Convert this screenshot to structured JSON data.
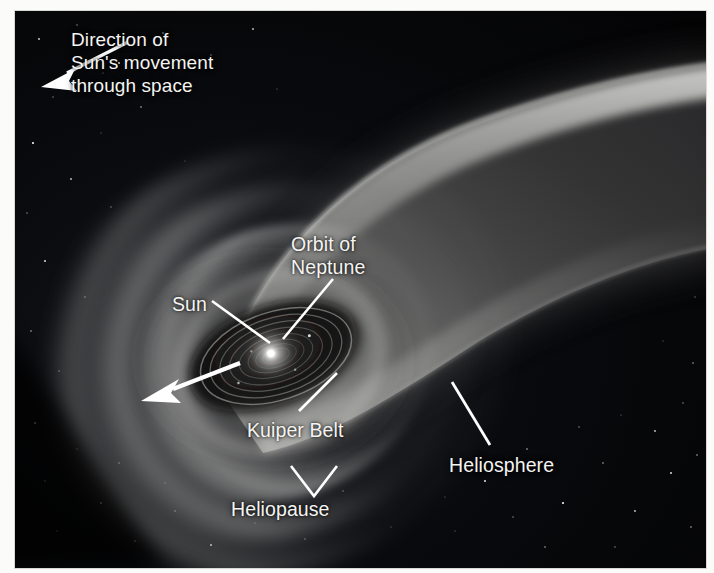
{
  "figure": {
    "background_color": "#050506",
    "label_color": "#f4f4f2",
    "plate_border_color": "#d8d8d6"
  },
  "labels": {
    "direction": "Direction of\nSun's movement\nthrough space",
    "orbit_of_neptune": "Orbit of\nNeptune",
    "sun": "Sun",
    "kuiper_belt": "Kuiper Belt",
    "heliopause": "Heliopause",
    "heliosphere": "Heliosphere"
  },
  "annotations": [
    {
      "name": "direction-of-motion-arrow",
      "kind": "arrow",
      "points_to": "upper-left / direction of travel",
      "color": "#ffffff"
    },
    {
      "name": "sun-motion-arrow",
      "kind": "arrow",
      "points_to": "lower-left away from the Sun",
      "color": "#ffffff"
    },
    {
      "name": "orbit-of-neptune-leader",
      "kind": "leader-line",
      "color": "#ffffff"
    },
    {
      "name": "sun-leader",
      "kind": "leader-line",
      "color": "#ffffff"
    },
    {
      "name": "kuiper-belt-leader",
      "kind": "leader-line",
      "color": "#ffffff"
    },
    {
      "name": "heliopause-bracket",
      "kind": "v-bracket",
      "color": "#ffffff"
    },
    {
      "name": "heliosphere-leader",
      "kind": "leader-line",
      "color": "#ffffff"
    }
  ],
  "scene_features": [
    {
      "name": "starfield",
      "description": "scattered white stars on black space background"
    },
    {
      "name": "heliosphere-tail",
      "description": "broad comet-like grey tail extending to the upper right"
    },
    {
      "name": "bow-shock-arcs",
      "description": "nested bright arcs ahead of the Sun on the lower left"
    },
    {
      "name": "sun-disk",
      "description": "bright point-like Sun with concentric planetary orbit ellipses"
    }
  ]
}
